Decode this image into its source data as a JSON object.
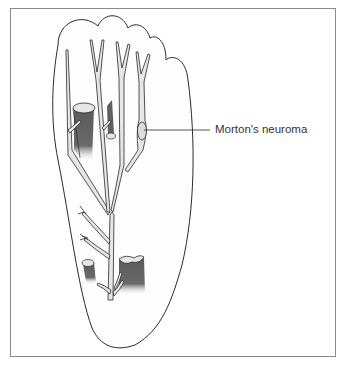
{
  "figure": {
    "labels": [
      {
        "text": "Morton's neuroma",
        "target": "neuroma between third and fourth metatarsal heads"
      }
    ]
  },
  "colors": {
    "outline": "#2a2a2a",
    "nerve_fill": "#e4e4e4",
    "muscle_stump": "#6e6e6e",
    "frame": "#8a8a8a",
    "background": "#ffffff"
  }
}
